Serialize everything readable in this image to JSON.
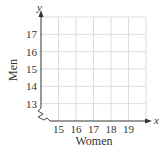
{
  "chart_data": {
    "type": "scatter",
    "title": "",
    "xlabel": "Women",
    "ylabel": "Men",
    "x_axis_variable": "x",
    "y_axis_variable": "y",
    "x_ticks": [
      15,
      16,
      17,
      18,
      19
    ],
    "y_ticks": [
      13,
      14,
      15,
      16,
      17
    ],
    "xlim": [
      14,
      20
    ],
    "ylim": [
      12,
      18
    ],
    "grid": true,
    "axis_break": true,
    "series": [],
    "points": []
  },
  "colors": {
    "grid": "#dcdcdc",
    "axis": "#333333",
    "text": "#333333"
  }
}
